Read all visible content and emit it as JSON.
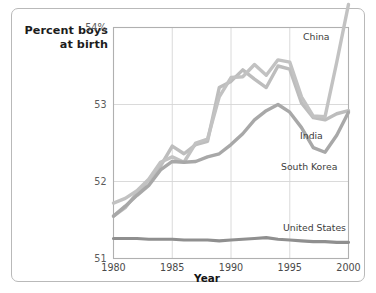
{
  "chart_data": {
    "type": "line",
    "title": "",
    "ylabel_line1": "Percent boys",
    "ylabel_line2": "at birth",
    "xlabel": "Year",
    "xlim": [
      1980,
      2000
    ],
    "ylim": [
      51,
      54
    ],
    "grid": true,
    "legend_position": "inline-right",
    "yticks": [
      "54%",
      "53",
      "52",
      "51"
    ],
    "ytick_values": [
      54,
      53,
      52,
      51
    ],
    "xticks": [
      "1980",
      "1985",
      "1990",
      "1995",
      "2000"
    ],
    "xtick_values": [
      1980,
      1985,
      1990,
      1995,
      2000
    ],
    "x": [
      1980,
      1981,
      1982,
      1983,
      1984,
      1985,
      1986,
      1987,
      1988,
      1989,
      1990,
      1991,
      1992,
      1993,
      1994,
      1995,
      1996,
      1997,
      1998,
      1999,
      2000
    ],
    "series": [
      {
        "name": "China",
        "color": "#c2c2c2",
        "label": "China",
        "values": [
          51.72,
          51.78,
          51.88,
          52.03,
          52.25,
          52.32,
          52.25,
          52.5,
          52.55,
          53.1,
          53.35,
          53.36,
          53.52,
          53.38,
          53.58,
          53.55,
          53.1,
          52.85,
          52.84,
          53.55,
          54.3
        ]
      },
      {
        "name": "India",
        "color": "#bdbdbd",
        "label": "India",
        "values": [
          51.55,
          51.66,
          51.85,
          52.02,
          52.2,
          52.46,
          52.36,
          52.48,
          52.52,
          53.22,
          53.3,
          53.45,
          53.33,
          53.22,
          53.5,
          53.46,
          53.02,
          52.83,
          52.8,
          52.88,
          52.92
        ]
      },
      {
        "name": "South Korea",
        "color": "#a8a8a8",
        "label": "South Korea",
        "values": [
          51.55,
          51.68,
          51.82,
          51.95,
          52.15,
          52.26,
          52.25,
          52.26,
          52.32,
          52.36,
          52.48,
          52.62,
          52.8,
          52.92,
          53.0,
          52.9,
          52.7,
          52.44,
          52.38,
          52.6,
          52.9
        ]
      },
      {
        "name": "United States",
        "color": "#8f8f8f",
        "label": "United States",
        "values": [
          51.26,
          51.26,
          51.26,
          51.25,
          51.25,
          51.25,
          51.24,
          51.24,
          51.24,
          51.23,
          51.24,
          51.25,
          51.26,
          51.27,
          51.25,
          51.24,
          51.23,
          51.22,
          51.22,
          51.21,
          51.21
        ]
      }
    ]
  }
}
